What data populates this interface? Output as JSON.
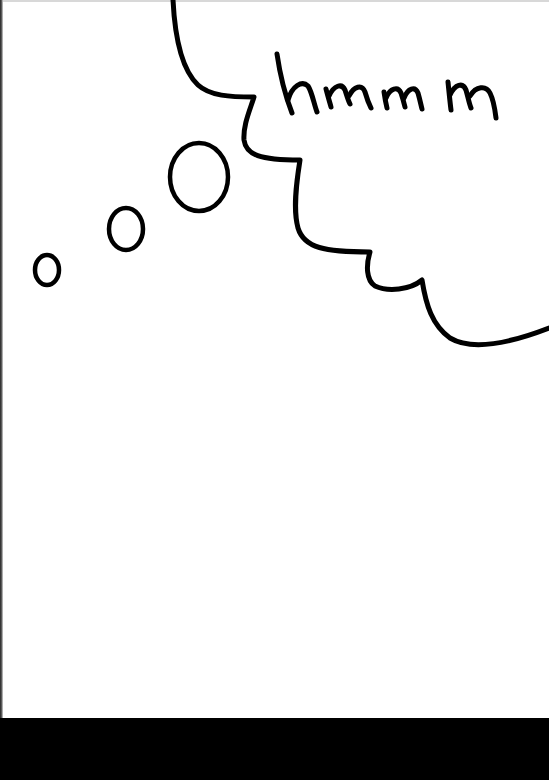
{
  "drawing": {
    "caption_text": "hmmm",
    "ink_color": "#000000",
    "paper_color": "#ffffff",
    "background_color": "#000000",
    "elements": [
      {
        "type": "thought-cloud-outline",
        "label": "cloud-edge"
      },
      {
        "type": "thought-bubble",
        "size": "large"
      },
      {
        "type": "thought-bubble",
        "size": "medium"
      },
      {
        "type": "thought-bubble",
        "size": "small"
      }
    ]
  }
}
